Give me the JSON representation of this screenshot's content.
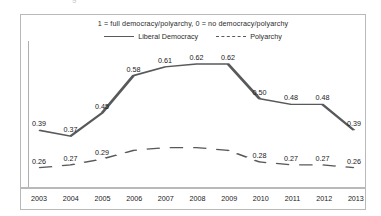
{
  "subtitle": "1 = full democracy/polyarchy, 0 = no democracy/polyarchy",
  "top_artifact": "g",
  "legend": {
    "entries": [
      {
        "label": "Liberal Democracy",
        "style": "solid"
      },
      {
        "label": "Polyarchy",
        "style": "dashed"
      }
    ]
  },
  "chart_data": {
    "type": "line",
    "title": "",
    "subtitle": "1 = full democracy/polyarchy, 0 = no democracy/polyarchy",
    "xlabel": "",
    "ylabel": "",
    "grid": false,
    "legend_position": "top-center",
    "categories": [
      "2003",
      "2004",
      "2005",
      "2006",
      "2007",
      "2008",
      "2009",
      "2010",
      "2011",
      "2012",
      "2013"
    ],
    "ylim": [
      0.2,
      0.7
    ],
    "series": [
      {
        "name": "Liberal Democracy",
        "style": "solid",
        "color": "#58595b",
        "values": [
          0.39,
          0.37,
          0.45,
          0.58,
          0.61,
          0.62,
          0.62,
          0.5,
          0.48,
          0.48,
          0.39
        ],
        "labels": [
          "0.39",
          "0.37",
          "0.45",
          "0.58",
          "0.61",
          "0.62",
          "0.62",
          "0.50",
          "0.48",
          "0.48",
          "0.39"
        ]
      },
      {
        "name": "Polyarchy",
        "style": "dashed",
        "color": "#58595b",
        "values": [
          0.26,
          0.27,
          0.29,
          0.32,
          0.33,
          0.33,
          0.32,
          0.28,
          0.27,
          0.27,
          0.26
        ],
        "labels": [
          "0.26",
          "0.27",
          "0.29",
          "",
          "",
          "",
          "",
          "0.28",
          "0.27",
          "0.27",
          "0.26"
        ]
      }
    ]
  }
}
